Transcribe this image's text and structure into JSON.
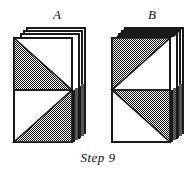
{
  "figure": {
    "caption": "Step 9",
    "background_color": "#ffffff",
    "ink_color": "#1a1a1a",
    "fill_gray": "#808080",
    "fill_white": "#ffffff",
    "panels": [
      {
        "id": "a",
        "label": "A",
        "name": "stack-a",
        "sheet_count": 4,
        "description": "stack of square sheets offset up and to the right; front sheet shows two gray triangles meeting at a point on the right edge midpoint",
        "front_face": {
          "top_half": {
            "gray_region": "lower-left triangle",
            "white_region": "upper-right triangle"
          },
          "bottom_half": {
            "gray_region": "lower-right triangle",
            "white_region": "upper-left triangle"
          },
          "apex_side": "right"
        }
      },
      {
        "id": "b",
        "label": "B",
        "name": "stack-b",
        "sheet_count": 4,
        "description": "stack of square sheets offset up and to the right; front sheet shows two gray triangles meeting at a point on the left edge midpoint",
        "front_face": {
          "top_half": {
            "gray_region": "upper-left triangle",
            "white_region": "lower-right triangle"
          },
          "bottom_half": {
            "gray_region": "upper-right triangle",
            "white_region": "lower-left triangle"
          },
          "apex_side": "left"
        }
      }
    ]
  }
}
